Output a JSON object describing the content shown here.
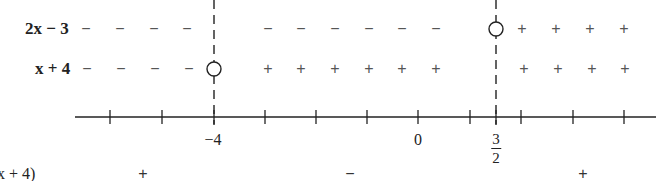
{
  "rows": [
    {
      "id": "factor-2x-minus-3",
      "label": "2x − 3",
      "y": 29,
      "label_x": 25,
      "signs": [
        {
          "x": 86,
          "s": "−"
        },
        {
          "x": 120,
          "s": "−"
        },
        {
          "x": 154,
          "s": "−"
        },
        {
          "x": 187,
          "s": "−"
        },
        {
          "x": 268,
          "s": "−"
        },
        {
          "x": 301,
          "s": "−"
        },
        {
          "x": 335,
          "s": "−"
        },
        {
          "x": 369,
          "s": "−"
        },
        {
          "x": 402,
          "s": "−"
        },
        {
          "x": 436,
          "s": "−"
        },
        {
          "x": 522,
          "s": "+"
        },
        {
          "x": 556,
          "s": "+"
        },
        {
          "x": 590,
          "s": "+"
        },
        {
          "x": 624,
          "s": "+"
        }
      ],
      "zero_at_x": 496
    },
    {
      "id": "factor-x-plus-4",
      "label": "x + 4",
      "y": 69,
      "label_x": 35,
      "signs": [
        {
          "x": 87,
          "s": "−"
        },
        {
          "x": 121,
          "s": "−"
        },
        {
          "x": 155,
          "s": "−"
        },
        {
          "x": 189,
          "s": "−"
        },
        {
          "x": 268,
          "s": "+"
        },
        {
          "x": 301,
          "s": "+"
        },
        {
          "x": 335,
          "s": "+"
        },
        {
          "x": 369,
          "s": "+"
        },
        {
          "x": 402,
          "s": "+"
        },
        {
          "x": 436,
          "s": "+"
        },
        {
          "x": 524,
          "s": "+"
        },
        {
          "x": 558,
          "s": "+"
        },
        {
          "x": 592,
          "s": "+"
        },
        {
          "x": 625,
          "s": "+"
        }
      ],
      "zero_at_x": 214
    }
  ],
  "axis": {
    "y": 117,
    "x_start": 75,
    "x_end": 656,
    "ticks_x": [
      110,
      162,
      214,
      265,
      316,
      367,
      418,
      470,
      496,
      521,
      573,
      624
    ],
    "labels": [
      {
        "id": "minus-four",
        "text": "−4",
        "x": 213
      },
      {
        "id": "zero",
        "text": "0",
        "x": 418
      }
    ],
    "fraction_label": {
      "x": 496,
      "numerator": "3",
      "denominator": "2"
    }
  },
  "critical_lines_x": [
    214,
    496
  ],
  "product_row": {
    "label": "(2x − 3)(x + 4)",
    "y": 166,
    "signs": [
      {
        "x": 143,
        "s": "+"
      },
      {
        "x": 350,
        "s": "−"
      },
      {
        "x": 583,
        "s": "+"
      }
    ]
  }
}
